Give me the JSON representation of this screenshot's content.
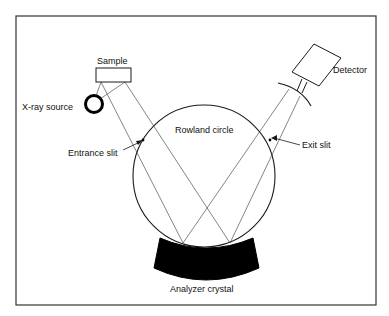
{
  "diagram": {
    "labels": {
      "sample": "Sample",
      "xray_source": "X-ray source",
      "detector": "Detector",
      "rowland_circle": "Rowland circle",
      "entrance_slit": "Entrance slit",
      "exit_slit": "Exit slit",
      "analyzer_crystal": "Analyzer crystal"
    },
    "colors": {
      "line": "#1a1a1a",
      "fill": "#000000",
      "background": "#ffffff"
    }
  }
}
